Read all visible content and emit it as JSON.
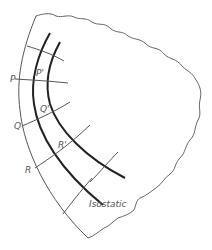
{
  "diagram": {
    "labels": {
      "p": "P",
      "p_prime": "P'",
      "q": "Q",
      "q_prime": "Q'",
      "r": "R",
      "r_prime": "R'",
      "isostatic": "Isostatic"
    },
    "colors": {
      "background": "#ffffff",
      "thin_line": "#555555",
      "thick_line": "#222222",
      "text": "#555555"
    }
  }
}
